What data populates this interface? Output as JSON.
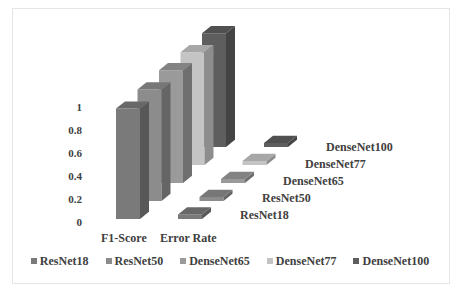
{
  "chart_data": {
    "type": "bar",
    "subtype": "3d-column",
    "title": "",
    "xlabel": "",
    "ylabel": "",
    "categories": [
      "F1-Score",
      "Error Rate"
    ],
    "series": [
      {
        "name": "ResNet18",
        "color": "#7a7a7a",
        "values": [
          0.96,
          0.04
        ]
      },
      {
        "name": "ResNet50",
        "color": "#8c8c8c",
        "values": [
          0.97,
          0.03
        ]
      },
      {
        "name": "DenseNet65",
        "color": "#9a9a9a",
        "values": [
          0.98,
          0.02
        ]
      },
      {
        "name": "DenseNet77",
        "color": "#c4c4c4",
        "values": [
          0.98,
          0.02
        ]
      },
      {
        "name": "DenseNet100",
        "color": "#5e5e5e",
        "values": [
          0.99,
          0.01
        ]
      }
    ],
    "yticks": [
      "0",
      "0.2",
      "0.4",
      "0.6",
      "0.8",
      "1"
    ],
    "ylim": [
      0,
      1
    ],
    "grid": false,
    "legend_position": "bottom"
  }
}
